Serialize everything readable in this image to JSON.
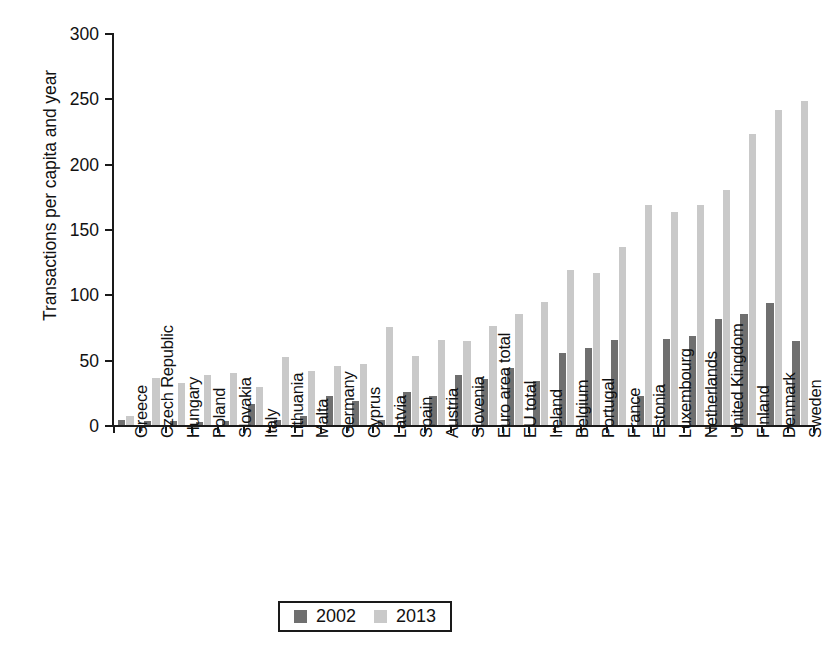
{
  "chart_data": {
    "type": "bar",
    "title": "",
    "xlabel": "",
    "ylabel": "Transactions per capita and year",
    "ylim": [
      0,
      300
    ],
    "yticks": [
      0,
      50,
      100,
      150,
      200,
      250,
      300
    ],
    "grid": false,
    "legend_position": "bottom-center",
    "categories": [
      "Greece",
      "Czech Republic",
      "Hungary",
      "Poland",
      "Slovakia",
      "Italy",
      "Lithuania",
      "Malta",
      "Germany",
      "Cyprus",
      "Latvia",
      "Spain",
      "Austria",
      "Slovenia",
      "Euro area total",
      "EU total",
      "Ireland",
      "Belgium",
      "Portugal",
      "France",
      "Estonia",
      "Luxembourg",
      "Netherlands",
      "United Kingdom",
      "Finland",
      "Denmark",
      "Sweden"
    ],
    "series": [
      {
        "name": "2002",
        "color": "#6f6f6f",
        "values": [
          4,
          3,
          3,
          2,
          3,
          16,
          4,
          7,
          22,
          18,
          4,
          25,
          22,
          38,
          35,
          44,
          34,
          55,
          59,
          65,
          22,
          66,
          68,
          81,
          85,
          93,
          64
        ]
      },
      {
        "name": "2013",
        "color": "#c9c9c9",
        "values": [
          7,
          36,
          32,
          38,
          40,
          29,
          52,
          41,
          45,
          47,
          75,
          53,
          65,
          64,
          76,
          85,
          94,
          119,
          116,
          136,
          168,
          163,
          168,
          180,
          223,
          241,
          248
        ]
      }
    ]
  },
  "legend": {
    "entries": [
      {
        "label": "2002",
        "color": "#6f6f6f"
      },
      {
        "label": "2013",
        "color": "#c9c9c9"
      }
    ]
  }
}
